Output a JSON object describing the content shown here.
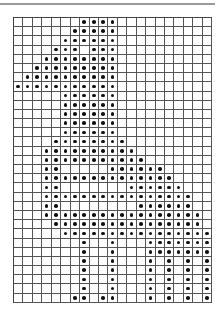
{
  "chart": {
    "columns": 21,
    "rows": 31,
    "cell_width": 9.45,
    "cell_height": 9.2,
    "line_color": "#555555",
    "dot_color": "#111111"
  },
  "filled_cells": [
    [
      8,
      9,
      10,
      11
    ],
    [
      7,
      8,
      9,
      10,
      11
    ],
    [
      6,
      7,
      8,
      9,
      10,
      11
    ],
    [
      5,
      6,
      7,
      9,
      10,
      11
    ],
    [
      4,
      5,
      6,
      7,
      8,
      9,
      10,
      11
    ],
    [
      3,
      4,
      5,
      6,
      7,
      8,
      9,
      10,
      11
    ],
    [
      2,
      3,
      4,
      5,
      6,
      7,
      8,
      9,
      10,
      11
    ],
    [
      1,
      2,
      3,
      4,
      5,
      6,
      7,
      8,
      9,
      10,
      11
    ],
    [
      6,
      7,
      8,
      9,
      10,
      11
    ],
    [
      6,
      7,
      8,
      9,
      10,
      11
    ],
    [
      6,
      7,
      8,
      9,
      10,
      11
    ],
    [
      6,
      7,
      8,
      9,
      10,
      11
    ],
    [
      6,
      7,
      8,
      9,
      10,
      11
    ],
    [
      5,
      6,
      7,
      8,
      9,
      10,
      11,
      12
    ],
    [
      4,
      5,
      6,
      7,
      8,
      9,
      10,
      11,
      12,
      13
    ],
    [
      4,
      5,
      6,
      7,
      8,
      9,
      10,
      11,
      12,
      13,
      14
    ],
    [
      4,
      5,
      11,
      12,
      13,
      14,
      15,
      16
    ],
    [
      4,
      5,
      6,
      7,
      8,
      9,
      10,
      11,
      12,
      13,
      14,
      15,
      16,
      17
    ],
    [
      4,
      5,
      13,
      14,
      15,
      16,
      17,
      18
    ],
    [
      4,
      5,
      6,
      7,
      8,
      9,
      10,
      11,
      12,
      13,
      14,
      15,
      16,
      17,
      18,
      19
    ],
    [
      4,
      5,
      14,
      15,
      16,
      17,
      18,
      19
    ],
    [
      4,
      5,
      6,
      7,
      8,
      9,
      10,
      11,
      12,
      13,
      14,
      15,
      16,
      17,
      18,
      19,
      20
    ],
    [
      5,
      6,
      7,
      8,
      9,
      10,
      11,
      12,
      13,
      14,
      15,
      16,
      17,
      18,
      19,
      20
    ],
    [
      6,
      7,
      8,
      9,
      10,
      11,
      12,
      13,
      14,
      15,
      16,
      17,
      18,
      19,
      20,
      21
    ],
    [
      8,
      11,
      15,
      16,
      17,
      18,
      19,
      20,
      21
    ],
    [
      8,
      11,
      15,
      16,
      17,
      18,
      19,
      20,
      21
    ],
    [
      8,
      11,
      15,
      17,
      19,
      21
    ],
    [
      8,
      11,
      15,
      17,
      19,
      21
    ],
    [
      8,
      11,
      15,
      17,
      19,
      21
    ],
    [
      8,
      11,
      15,
      17,
      19,
      21
    ],
    [
      7,
      8,
      10,
      11,
      15,
      17,
      19,
      21
    ]
  ]
}
